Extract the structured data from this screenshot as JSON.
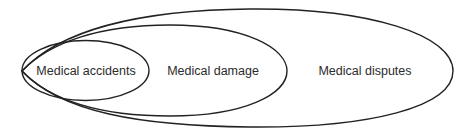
{
  "diagram": {
    "type": "nested-set (Euler) diagram",
    "stroke_color": "#222222",
    "background": "#ffffff",
    "sets": [
      {
        "id": "medical-accidents",
        "label": "Medical accidents",
        "level": "innermost"
      },
      {
        "id": "medical-damage",
        "label": "Medical damage",
        "level": "middle"
      },
      {
        "id": "medical-disputes",
        "label": "Medical disputes",
        "level": "outermost"
      }
    ]
  }
}
